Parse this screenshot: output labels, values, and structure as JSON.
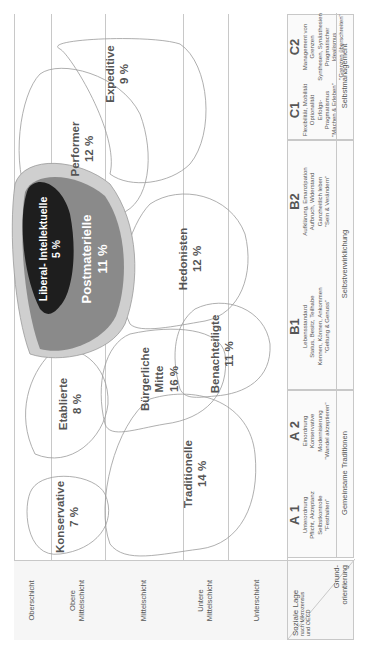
{
  "diagram": {
    "orientation": "rotated -90deg (landscape content shown in portrait)",
    "rows": [
      {
        "label": "Oberschicht"
      },
      {
        "label": "Obere Mittelschicht"
      },
      {
        "label": "Mittelschicht"
      },
      {
        "label": "Untere Mittelschicht"
      },
      {
        "label": "Unterschicht"
      }
    ],
    "axis_corner": {
      "top_label": "Soziale Lage",
      "top_sublabel_1": "nach Mikrozensus",
      "top_sublabel_2": "und OECD",
      "bottom_label_1": "Grund-",
      "bottom_label_2": "orientierung"
    },
    "orientations": [
      {
        "code": "A 1",
        "lines": [
          "Unterordnung",
          "Pflicht, Akzeptanz",
          "Selbstkontrolle",
          "\"Festhalten\""
        ]
      },
      {
        "code": "A 2",
        "lines": [
          "Einordnung",
          "Konservative",
          "Modernisierung",
          "\"Wandel akzeptieren\""
        ]
      },
      {
        "code": "B1",
        "lines": [
          "Lebensstandard",
          "Status, Besitz, Teilhabe",
          "Kennen, Können, Ankommen",
          "\"Geltung & Genuss\""
        ]
      },
      {
        "code": "B2",
        "lines": [
          "Aufklärung, Emanzipation",
          "Aufbruch, Widerstand",
          "Ganzheitlich leben",
          "\"Sein & Verändern\""
        ]
      },
      {
        "code": "C1",
        "lines": [
          "Flexibilität, Mobilität",
          "Optionalität",
          "Erfolgs-Pragmatismus",
          "\"Machen & Erleben\""
        ]
      },
      {
        "code": "C2",
        "lines": [
          "Management von Grenzen",
          "Synthesen, Synästhesien",
          "Pragmatischer Idealismus",
          "\"Grenzen überschreiten\""
        ]
      }
    ],
    "groups": [
      {
        "label": "Gemeinsame Traditionen"
      },
      {
        "label": "Selbstverwirklichung"
      },
      {
        "label": "Selbstmanagement"
      }
    ],
    "milieus": [
      {
        "name": "Konservative",
        "share": "7 %"
      },
      {
        "name": "Etablierte",
        "share": "8 %"
      },
      {
        "name": "Liberal- Intellektuelle",
        "share": "5 %"
      },
      {
        "name": "Postmaterielle",
        "share": "11 %"
      },
      {
        "name": "Performer",
        "share": "12 %"
      },
      {
        "name": "Expeditive",
        "share": "9 %"
      },
      {
        "name": "Bürgerliche",
        "name2": "Mitte",
        "share": "16 %"
      },
      {
        "name": "Hedonisten",
        "share": "12 %"
      },
      {
        "name": "Traditionelle",
        "share": "14 %"
      },
      {
        "name": "Benachteiligte",
        "share": "11 %"
      }
    ],
    "colors": {
      "liberal_intellektuelle": "#1e1e1e",
      "postmaterielle": "#8a8a8a",
      "postmaterielle_halo": "#cfcfcf",
      "outline": "#9a9a9a",
      "text": "#555555"
    }
  }
}
